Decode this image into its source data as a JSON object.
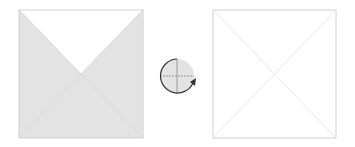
{
  "diagram": {
    "left_square": {
      "x": 19,
      "y": 10,
      "w": 124,
      "h": 128,
      "fill": "#e3e3e3",
      "stroke": "#d0d0d0",
      "top_triangle_fill": "#ffffff"
    },
    "rotation_icon": {
      "cx": 177,
      "cy": 76,
      "r": 17,
      "fill": "#e3e3e3",
      "stroke": "#333333",
      "direction": "clockwise"
    },
    "right_square": {
      "x": 213,
      "y": 10,
      "w": 123,
      "h": 128,
      "fill": "#ffffff",
      "stroke": "#d0d0d0"
    },
    "diagonal_color": "#d6d6d6"
  }
}
